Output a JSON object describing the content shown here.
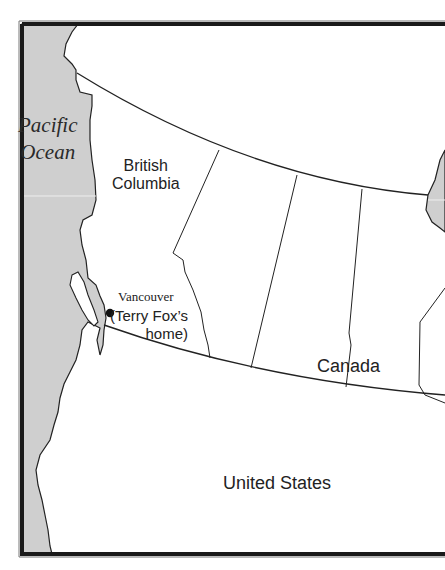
{
  "map": {
    "title": "Map of Western Canada",
    "colors": {
      "water": "#cfcfcf",
      "land": "#ffffff",
      "border": "#222222",
      "frame": "#2a2a2a"
    },
    "labels": {
      "ocean_line1": "Pacific",
      "ocean_line2": "Ocean",
      "province_line1": "British",
      "province_line2": "Columbia",
      "city": "Vancouver",
      "note_line1": "(Terry Fox’s",
      "note_line2": "home)",
      "country_north": "Canada",
      "country_south": "United States"
    },
    "markers": [
      {
        "name": "Vancouver",
        "x": 110,
        "y": 313,
        "icon": "city-dot-icon"
      }
    ]
  }
}
